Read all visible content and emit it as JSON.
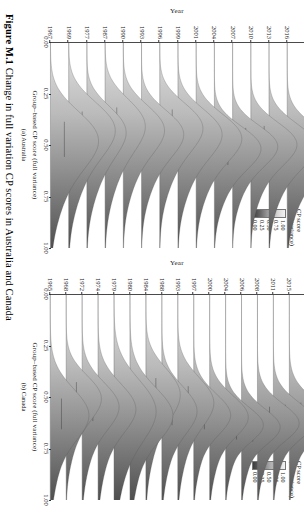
{
  "caption": {
    "number": "Figure M.1",
    "text": "Change in full variation CP scores in Australia and Canada"
  },
  "legend": {
    "title_line1": "CP score",
    "title_line2": "(full variance)",
    "labels": [
      "1.00",
      "0.75",
      "0.50",
      "0.25",
      "0.00"
    ],
    "gradient_high_color": "#f2f2f2",
    "gradient_low_color": "#3c3c3c"
  },
  "axes": {
    "x_title": "Group–based CP score (full variance)",
    "x_ticks": [
      "0.00",
      "0.25",
      "0.50",
      "0.75",
      "1.00"
    ],
    "x_values": [
      0.0,
      0.25,
      0.5,
      0.75,
      1.0
    ],
    "y_title": "Year"
  },
  "panels": [
    {
      "key": "a",
      "label": "(a) Australia"
    },
    {
      "key": "b",
      "label": "(b) Canada"
    }
  ],
  "chart_data": [
    {
      "type": "area",
      "title": "(a) Australia",
      "xlabel": "Group–based CP score (full variance)",
      "ylabel": "Year",
      "xlim": [
        0.0,
        1.0
      ],
      "grid": false,
      "legend_position": "top-right",
      "categories": [
        "2016",
        "2013",
        "2010",
        "2007",
        "2004",
        "2001",
        "1999",
        "1996",
        "1993",
        "1990",
        "1987",
        "1977",
        "1969",
        "1967"
      ],
      "rows": [
        {
          "year": "2016",
          "median": 0.52,
          "spread": 0.115,
          "peak_height": 1.0,
          "skew": 0.05
        },
        {
          "year": "2013",
          "median": 0.5,
          "spread": 0.11,
          "peak_height": 0.96,
          "skew": 0.05
        },
        {
          "year": "2010",
          "median": 0.49,
          "spread": 0.105,
          "peak_height": 0.94,
          "skew": 0.04
        },
        {
          "year": "2007",
          "median": 0.5,
          "spread": 0.1,
          "peak_height": 0.92,
          "skew": 0.04
        },
        {
          "year": "2004",
          "median": 0.51,
          "spread": 0.105,
          "peak_height": 0.95,
          "skew": 0.05
        },
        {
          "year": "2001",
          "median": 0.46,
          "spread": 0.115,
          "peak_height": 0.93,
          "skew": 0.06
        },
        {
          "year": "1999",
          "median": 0.44,
          "spread": 0.12,
          "peak_height": 0.9,
          "skew": 0.07
        },
        {
          "year": "1996",
          "median": 0.41,
          "spread": 0.12,
          "peak_height": 0.88,
          "skew": 0.08
        },
        {
          "year": "1993",
          "median": 0.44,
          "spread": 0.115,
          "peak_height": 0.86,
          "skew": 0.07
        },
        {
          "year": "1990",
          "median": 0.42,
          "spread": 0.12,
          "peak_height": 0.84,
          "skew": 0.07
        },
        {
          "year": "1987",
          "median": 0.4,
          "spread": 0.13,
          "peak_height": 0.82,
          "skew": 0.09
        },
        {
          "year": "1977",
          "median": 0.43,
          "spread": 0.125,
          "peak_height": 0.8,
          "skew": 0.1
        },
        {
          "year": "1969",
          "median": 0.42,
          "spread": 0.135,
          "peak_height": 0.95,
          "skew": 0.08
        },
        {
          "year": "1967",
          "median": 0.47,
          "spread": 0.14,
          "peak_height": 0.98,
          "skew": 0.06
        }
      ]
    },
    {
      "type": "area",
      "title": "(b) Canada",
      "xlabel": "Group–based CP score (full variance)",
      "ylabel": "Year",
      "xlim": [
        0.0,
        1.0
      ],
      "grid": false,
      "legend_position": "top-right",
      "categories": [
        "2015",
        "2011",
        "2008",
        "2006",
        "2004",
        "2000",
        "1997",
        "1993",
        "1988",
        "1984",
        "1980",
        "1979",
        "1974",
        "1972",
        "1968",
        "1965"
      ],
      "rows": [
        {
          "year": "2015",
          "median": 0.6,
          "spread": 0.095,
          "peak_height": 0.92,
          "skew": -0.04
        },
        {
          "year": "2011",
          "median": 0.61,
          "spread": 0.09,
          "peak_height": 0.95,
          "skew": -0.04
        },
        {
          "year": "2008",
          "median": 0.62,
          "spread": 0.09,
          "peak_height": 0.97,
          "skew": -0.05
        },
        {
          "year": "2006",
          "median": 0.64,
          "spread": 0.085,
          "peak_height": 0.9,
          "skew": -0.05
        },
        {
          "year": "2004",
          "median": 0.63,
          "spread": 0.085,
          "peak_height": 0.88,
          "skew": -0.05
        },
        {
          "year": "2000",
          "median": 0.59,
          "spread": 0.1,
          "peak_height": 0.9,
          "skew": -0.03
        },
        {
          "year": "1997",
          "median": 0.58,
          "spread": 0.1,
          "peak_height": 0.86,
          "skew": -0.03
        },
        {
          "year": "1993",
          "median": 0.52,
          "spread": 0.12,
          "peak_height": 0.84,
          "skew": 0.02
        },
        {
          "year": "1988",
          "median": 0.56,
          "spread": 0.115,
          "peak_height": 0.82,
          "skew": 0.0
        },
        {
          "year": "1984",
          "median": 0.48,
          "spread": 0.125,
          "peak_height": 0.8,
          "skew": 0.05
        },
        {
          "year": "1980",
          "median": 0.58,
          "spread": 0.13,
          "peak_height": 1.0,
          "skew": -0.02
        },
        {
          "year": "1979",
          "median": 0.56,
          "spread": 0.15,
          "peak_height": 0.98,
          "skew": 0.02
        },
        {
          "year": "1974",
          "median": 0.55,
          "spread": 0.12,
          "peak_height": 0.88,
          "skew": 0.0
        },
        {
          "year": "1972",
          "median": 0.54,
          "spread": 0.115,
          "peak_height": 0.86,
          "skew": 0.01
        },
        {
          "year": "1968",
          "median": 0.5,
          "spread": 0.11,
          "peak_height": 0.82,
          "skew": 0.03
        },
        {
          "year": "1965",
          "median": 0.58,
          "spread": 0.125,
          "peak_height": 0.9,
          "skew": -0.01
        }
      ]
    }
  ]
}
